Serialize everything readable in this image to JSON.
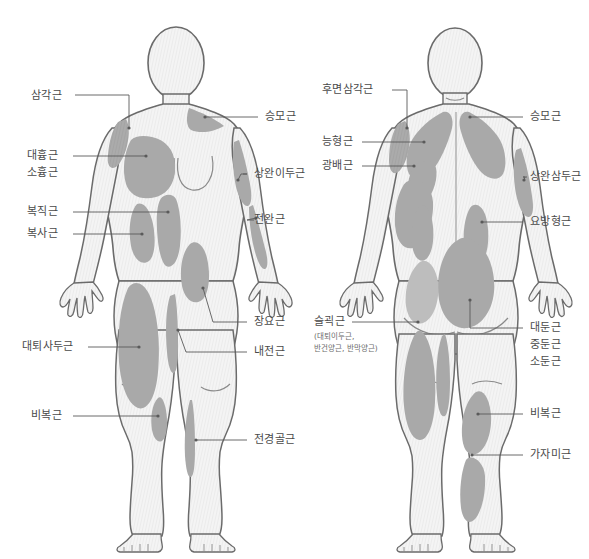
{
  "diagram": {
    "figures": [
      {
        "name": "front-view-figure",
        "view": "anterior"
      },
      {
        "name": "back-view-figure",
        "view": "posterior"
      }
    ],
    "colors": {
      "background": "#ffffff",
      "body_fill": "#f2f2f2",
      "body_outline": "#6b6b6b",
      "muscle_fill": "#a9a9a9",
      "muscle_fill_light": "#bdbdbd",
      "leader_line": "#5a5a5a",
      "label_text": "#4a4a4a",
      "sub_label_text": "#6a6a6a"
    }
  },
  "front": {
    "left_labels": [
      {
        "id": "deltoid",
        "text": "삼각근"
      },
      {
        "id": "pectoralis-major",
        "text": "대흉근"
      },
      {
        "id": "pectoralis-minor",
        "text": "소흉근"
      },
      {
        "id": "rectus-abdominis",
        "text": "복직근"
      },
      {
        "id": "obliques",
        "text": "복사근"
      },
      {
        "id": "quadriceps",
        "text": "대퇴사두근"
      },
      {
        "id": "gastrocnemius",
        "text": "비복근"
      }
    ],
    "right_labels": [
      {
        "id": "trapezius",
        "text": "승모근"
      },
      {
        "id": "biceps-brachii",
        "text": "상완이두근"
      },
      {
        "id": "forearm",
        "text": "전완근"
      },
      {
        "id": "iliopsoas",
        "text": "장요근"
      },
      {
        "id": "adductors",
        "text": "내전근"
      },
      {
        "id": "tibialis-anterior",
        "text": "전경골근"
      }
    ]
  },
  "back": {
    "left_labels": [
      {
        "id": "posterior-deltoid",
        "text": "후면삼각근"
      },
      {
        "id": "rhomboids",
        "text": "능형근"
      },
      {
        "id": "latissimus-dorsi",
        "text": "광배근"
      },
      {
        "id": "hamstrings",
        "text": "슬괵근"
      }
    ],
    "hamstrings_sub": [
      "(대퇴이두근,",
      "반건양근, 반막양근)"
    ],
    "right_labels": [
      {
        "id": "trapezius",
        "text": "승모근"
      },
      {
        "id": "triceps-brachii",
        "text": "상완삼두근"
      },
      {
        "id": "quadratus-lumborum",
        "text": "요방형근"
      },
      {
        "id": "gluteus-maximus",
        "text": "대둔근"
      },
      {
        "id": "gluteus-medius",
        "text": "중둔근"
      },
      {
        "id": "gluteus-minimus",
        "text": "소둔근"
      },
      {
        "id": "gastrocnemius",
        "text": "비복근"
      },
      {
        "id": "soleus",
        "text": "가자미근"
      }
    ]
  }
}
